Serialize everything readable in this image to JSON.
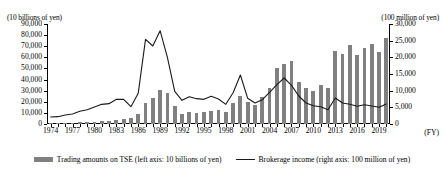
{
  "axes": {
    "left_unit": "(10 billions of yen)",
    "right_unit": "(100 million of yen)",
    "x_unit": "(FY)",
    "left_ticks": [
      "90,000",
      "80,000",
      "70,000",
      "60,000",
      "50,000",
      "40,000",
      "30,000",
      "20,000",
      "10,000",
      "0"
    ],
    "right_ticks": [
      "30,000",
      "25,000",
      "20,000",
      "15,000",
      "10,000",
      "5,000",
      "0"
    ]
  },
  "legend": {
    "bar_label": "Trading amounts on TSE (left axis: 10 billions of yen)",
    "line_label": "Brokerage income (right axis: 100 million of yen)"
  },
  "chart_data": {
    "type": "bar",
    "title": "",
    "xlabel": "(FY)",
    "ylabel": "(10 billions of yen)",
    "y2label": "(100 million of yen)",
    "ylim": [
      0,
      90000
    ],
    "y2lim": [
      0,
      30000
    ],
    "grid": false,
    "legend_position": "bottom",
    "x": [
      1974,
      1975,
      1976,
      1977,
      1978,
      1979,
      1980,
      1981,
      1982,
      1983,
      1984,
      1985,
      1986,
      1987,
      1988,
      1989,
      1990,
      1991,
      1992,
      1993,
      1994,
      1995,
      1996,
      1997,
      1998,
      1999,
      2000,
      2001,
      2002,
      2003,
      2004,
      2005,
      2006,
      2007,
      2008,
      2009,
      2010,
      2011,
      2012,
      2013,
      2014,
      2015,
      2016,
      2017,
      2018,
      2019,
      2020
    ],
    "xtick_labels": [
      "1974",
      "1977",
      "1980",
      "1983",
      "1986",
      "1989",
      "1992",
      "1995",
      "1998",
      "2001",
      "2004",
      "2007",
      "2010",
      "2013",
      "2016",
      "2019"
    ],
    "series": [
      {
        "name": "Trading amounts on TSE (left axis: 10 billions of yen)",
        "type": "bar",
        "axis": "left",
        "color": "#808080",
        "values": [
          900,
          900,
          1100,
          1300,
          1800,
          1800,
          2100,
          2900,
          2400,
          3700,
          4200,
          5200,
          8900,
          19200,
          23000,
          31000,
          28000,
          16000,
          9000,
          10500,
          10200,
          11000,
          12000,
          12500,
          11000,
          18500,
          25000,
          19500,
          17000,
          24000,
          32000,
          50000,
          54000,
          57000,
          38000,
          32000,
          30000,
          35000,
          32000,
          66000,
          63000,
          71000,
          62000,
          68000,
          72000,
          65000,
          77000
        ]
      },
      {
        "name": "Brokerage income (right axis: 100 million of yen)",
        "type": "line",
        "axis": "right",
        "color": "#1a1a1a",
        "values": [
          2100,
          2200,
          2700,
          3000,
          3800,
          4300,
          5100,
          5900,
          6100,
          7400,
          7400,
          5200,
          9200,
          25400,
          23400,
          28000,
          20000,
          9800,
          7100,
          8200,
          7600,
          7400,
          8300,
          7500,
          5900,
          9400,
          14700,
          7700,
          6300,
          7300,
          9500,
          11800,
          13800,
          11600,
          8400,
          6300,
          5500,
          5200,
          4300,
          7800,
          6300,
          5900,
          5300,
          5800,
          5400,
          5000,
          6000
        ]
      }
    ]
  }
}
